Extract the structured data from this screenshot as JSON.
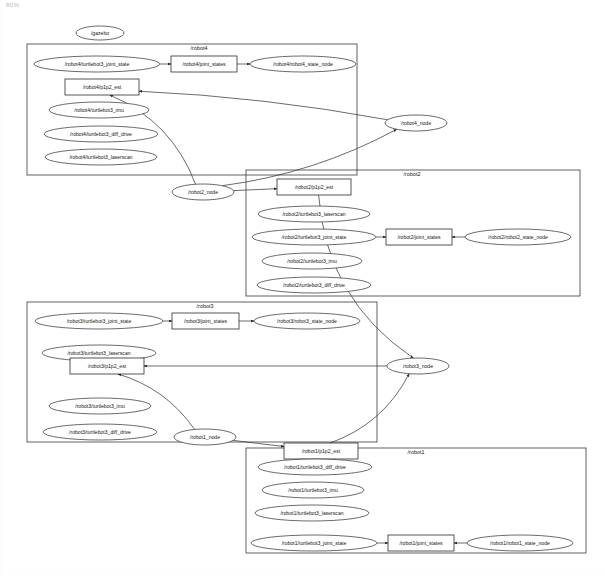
{
  "window": {
    "corner_mark": "80%",
    "background_color": "#ffffff",
    "stroke_color": "#2b2b2b",
    "width": 605,
    "height": 576
  },
  "graph": {
    "type": "ros-computation-graph",
    "standalone_nodes": [
      {
        "id": "gazebo",
        "label": "/gazebo",
        "shape": "ellipse",
        "x": 100,
        "y": 33,
        "rx": 24,
        "ry": 7
      },
      {
        "id": "robot4_node",
        "label": "/robot4_node",
        "shape": "ellipse",
        "x": 416,
        "y": 123,
        "rx": 31,
        "ry": 8
      },
      {
        "id": "robot2_node",
        "label": "/robot2_node",
        "shape": "ellipse",
        "x": 203,
        "y": 192,
        "rx": 31,
        "ry": 8
      },
      {
        "id": "robot3_node",
        "label": "/robot3_node",
        "shape": "ellipse",
        "x": 418,
        "y": 366,
        "rx": 31,
        "ry": 8
      },
      {
        "id": "robot1_node",
        "label": "/robot1_node",
        "shape": "ellipse",
        "x": 205,
        "y": 437,
        "rx": 31,
        "ry": 8
      }
    ],
    "groups": [
      {
        "id": "robot4",
        "label": "/robot4",
        "x": 27,
        "y": 44,
        "width": 330,
        "height": 131,
        "label_x": 199,
        "label_y": 49,
        "nodes": [
          {
            "id": "robot4_joint_state",
            "label": "/robot4/turtlebot3_joint_state",
            "shape": "ellipse",
            "x": 97,
            "y": 64,
            "rx": 63,
            "ry": 8
          },
          {
            "id": "robot4_joint_states",
            "label": "/robot4/joint_states",
            "shape": "box",
            "x": 171,
            "y": 56,
            "width": 66,
            "height": 16
          },
          {
            "id": "robot4_state_node",
            "label": "/robot4/robot4_state_node",
            "shape": "ellipse",
            "x": 303,
            "y": 64,
            "rx": 53,
            "ry": 8
          },
          {
            "id": "robot4_p1p2_est",
            "label": "/robot4/p1p2_est",
            "shape": "box",
            "x": 65,
            "y": 79,
            "width": 74,
            "height": 16
          },
          {
            "id": "robot4_imu",
            "label": "/robot4/turtlebot3_imu",
            "shape": "ellipse",
            "x": 99,
            "y": 110,
            "rx": 50,
            "ry": 8
          },
          {
            "id": "robot4_diff_drive",
            "label": "/robot4/turtlebot3_diff_drive",
            "shape": "ellipse",
            "x": 101,
            "y": 134,
            "rx": 57,
            "ry": 8
          },
          {
            "id": "robot4_laserscan",
            "label": "/robot4/turtlebot3_laserscan",
            "shape": "ellipse",
            "x": 101,
            "y": 157,
            "rx": 56,
            "ry": 8
          }
        ]
      },
      {
        "id": "robot2",
        "label": "/robot2",
        "x": 246,
        "y": 170,
        "width": 334,
        "height": 126,
        "label_x": 412,
        "label_y": 175,
        "nodes": [
          {
            "id": "robot2_p1p2_est",
            "label": "/robot2/p1p2_est",
            "shape": "box",
            "x": 277,
            "y": 179,
            "width": 74,
            "height": 16
          },
          {
            "id": "robot2_laserscan",
            "label": "/robot2/turtlebot3_laserscan",
            "shape": "ellipse",
            "x": 314,
            "y": 214,
            "rx": 56,
            "ry": 8
          },
          {
            "id": "robot2_joint_state",
            "label": "/robot2/turtlebot3_joint_state",
            "shape": "ellipse",
            "x": 314,
            "y": 237,
            "rx": 62,
            "ry": 8
          },
          {
            "id": "robot2_joint_states",
            "label": "/robot2/joint_states",
            "shape": "box",
            "x": 386,
            "y": 229,
            "width": 66,
            "height": 16
          },
          {
            "id": "robot2_state_node",
            "label": "/robot2/robot2_state_node",
            "shape": "ellipse",
            "x": 518,
            "y": 237,
            "rx": 53,
            "ry": 8
          },
          {
            "id": "robot2_imu",
            "label": "/robot2/turtlebot3_imu",
            "shape": "ellipse",
            "x": 312,
            "y": 261,
            "rx": 50,
            "ry": 8
          },
          {
            "id": "robot2_diff_drive",
            "label": "/robot2/turtlebot3_diff_drive",
            "shape": "ellipse",
            "x": 314,
            "y": 285,
            "rx": 57,
            "ry": 8
          }
        ]
      },
      {
        "id": "robot3",
        "label": "/robot3",
        "x": 27,
        "y": 302,
        "width": 350,
        "height": 140,
        "label_x": 205,
        "label_y": 307,
        "nodes": [
          {
            "id": "robot3_joint_state",
            "label": "/robot3/turtlebot3_joint_state",
            "shape": "ellipse",
            "x": 99,
            "y": 321,
            "rx": 64,
            "ry": 8
          },
          {
            "id": "robot3_joint_states",
            "label": "/robot3/joint_states",
            "shape": "box",
            "x": 172,
            "y": 313,
            "width": 67,
            "height": 16
          },
          {
            "id": "robot3_state_node",
            "label": "/robot3/robot3_state_node",
            "shape": "ellipse",
            "x": 307,
            "y": 321,
            "rx": 53,
            "ry": 8
          },
          {
            "id": "robot3_laserscan",
            "label": "/robot3/turtlebot3_laserscan",
            "shape": "ellipse",
            "x": 99,
            "y": 353,
            "rx": 57,
            "ry": 8
          },
          {
            "id": "robot3_p1p2_est",
            "label": "/robot3/p1p2_est",
            "shape": "box",
            "x": 70,
            "y": 358,
            "width": 74,
            "height": 16
          },
          {
            "id": "robot3_imu",
            "label": "/robot3/turtlebot3_imu",
            "shape": "ellipse",
            "x": 100,
            "y": 406,
            "rx": 51,
            "ry": 8
          },
          {
            "id": "robot3_diff_drive",
            "label": "/robot3/turtlebot3_diff_drive",
            "shape": "ellipse",
            "x": 100,
            "y": 432,
            "rx": 57,
            "ry": 8
          }
        ]
      },
      {
        "id": "robot1",
        "label": "/robot1",
        "x": 246,
        "y": 448,
        "width": 340,
        "height": 105,
        "label_x": 416,
        "label_y": 453,
        "nodes": [
          {
            "id": "robot1_p1p2_est",
            "label": "/robot1/p1p2_est",
            "shape": "box",
            "x": 284,
            "y": 443,
            "width": 74,
            "height": 16
          },
          {
            "id": "robot1_diff_drive",
            "label": "/robot1/turtlebot3_diff_drive",
            "shape": "ellipse",
            "x": 315,
            "y": 467,
            "rx": 57,
            "ry": 8
          },
          {
            "id": "robot1_imu",
            "label": "/robot1/turtlebot3_imu",
            "shape": "ellipse",
            "x": 313,
            "y": 490,
            "rx": 51,
            "ry": 8
          },
          {
            "id": "robot1_laserscan",
            "label": "/robot1/turtlebot3_laserscan",
            "shape": "ellipse",
            "x": 312,
            "y": 513,
            "rx": 57,
            "ry": 8
          },
          {
            "id": "robot1_joint_state",
            "label": "/robot1/turtlebot3_joint_state",
            "shape": "ellipse",
            "x": 314,
            "y": 543,
            "rx": 63,
            "ry": 8
          },
          {
            "id": "robot1_joint_states",
            "label": "/robot1/joint_states",
            "shape": "box",
            "x": 388,
            "y": 535,
            "width": 66,
            "height": 16
          },
          {
            "id": "robot1_state_node",
            "label": "/robot1/robot1_state_node",
            "shape": "ellipse",
            "x": 520,
            "y": 543,
            "rx": 53,
            "ry": 8
          }
        ]
      }
    ],
    "edges": [
      {
        "from": "robot4_joint_state",
        "to": "robot4_joint_states"
      },
      {
        "from": "robot4_joint_states",
        "to": "robot4_state_node"
      },
      {
        "from": "robot4_node",
        "to": "robot4_p1p2_est"
      },
      {
        "from": "robot2_node",
        "to": "robot4_p1p2_est"
      },
      {
        "from": "robot2_node",
        "to": "robot2_p1p2_est"
      },
      {
        "from": "robot2_joint_state",
        "to": "robot2_joint_states"
      },
      {
        "from": "robot2_state_node",
        "to": "robot2_joint_states"
      },
      {
        "from": "robot2_node",
        "to": "robot4_node"
      },
      {
        "from": "robot3_joint_state",
        "to": "robot3_joint_states"
      },
      {
        "from": "robot3_joint_states",
        "to": "robot3_state_node"
      },
      {
        "from": "robot3_node",
        "to": "robot3_p1p2_est"
      },
      {
        "from": "robot1_node",
        "to": "robot3_p1p2_est"
      },
      {
        "from": "robot1_node",
        "to": "robot1_p1p2_est"
      },
      {
        "from": "robot1_p1p2_est",
        "to": "robot3_node"
      },
      {
        "from": "robot2_p1p2_est",
        "to": "robot3_node"
      },
      {
        "from": "robot1_joint_state",
        "to": "robot1_joint_states"
      },
      {
        "from": "robot1_state_node",
        "to": "robot1_joint_states"
      }
    ]
  }
}
